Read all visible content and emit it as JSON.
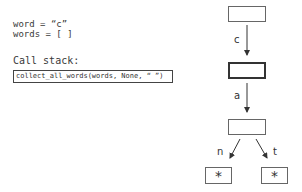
{
  "variables": {
    "word_line": "word = “c”",
    "words_line": "words = [ ]"
  },
  "call_stack": {
    "label": "Call stack:",
    "frames": [
      "collect_all_words(words, None, “ ”)"
    ]
  },
  "trie": {
    "nodes": [
      {
        "id": "root",
        "label": "",
        "current": false
      },
      {
        "id": "c",
        "label": "",
        "current": true
      },
      {
        "id": "ca",
        "label": "",
        "current": false
      },
      {
        "id": "can_end",
        "label": "*",
        "current": false
      },
      {
        "id": "cat_end",
        "label": "*",
        "current": false
      }
    ],
    "edges": [
      {
        "from": "root",
        "to": "c",
        "label": "c"
      },
      {
        "from": "c",
        "to": "ca",
        "label": "a"
      },
      {
        "from": "ca",
        "to": "can_end",
        "label": "n"
      },
      {
        "from": "ca",
        "to": "cat_end",
        "label": "t"
      }
    ]
  }
}
